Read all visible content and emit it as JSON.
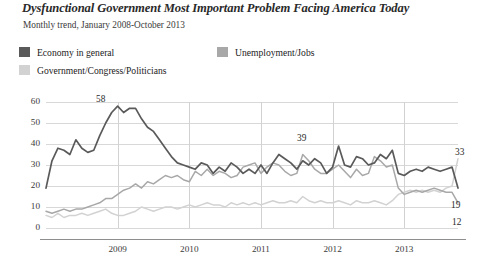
{
  "header": {
    "title": "Dysfunctional Government Most Important Problem Facing America Today",
    "subtitle": "Monthly trend, January 2008-October 2013"
  },
  "legend": [
    {
      "label": "Economy in general",
      "color": "#5a5a5a"
    },
    {
      "label": "Unemployment/Jobs",
      "color": "#a8a8a8"
    },
    {
      "label": "Government/Congress/Politicians",
      "color": "#d2d2d2"
    }
  ],
  "annotations": [
    {
      "name": "peak-economy",
      "value": "58"
    },
    {
      "name": "mid-economy",
      "value": "39"
    },
    {
      "name": "end-government",
      "value": "33"
    },
    {
      "name": "end-economy",
      "value": "19"
    },
    {
      "name": "end-unemployment",
      "value": "12"
    }
  ],
  "chart_data": {
    "type": "line",
    "title": "Dysfunctional Government Most Important Problem Facing America Today",
    "subtitle": "Monthly trend, January 2008-October 2013",
    "xlabel": "",
    "ylabel": "",
    "ylim": [
      0,
      60
    ],
    "yticks": [
      0,
      10,
      20,
      30,
      40,
      50,
      60
    ],
    "xticks": [
      "2009",
      "2010",
      "2011",
      "2012",
      "2013"
    ],
    "grid": true,
    "legend_position": "top",
    "x_start": "2008-01",
    "x_end": "2013-10",
    "series": [
      {
        "name": "Economy in general",
        "color": "#5a5a5a",
        "values": [
          19,
          32,
          38,
          37,
          35,
          42,
          38,
          36,
          37,
          44,
          50,
          55,
          58,
          55,
          57,
          57,
          52,
          48,
          46,
          42,
          38,
          34,
          31,
          30,
          29,
          28,
          31,
          30,
          26,
          29,
          27,
          31,
          29,
          26,
          28,
          26,
          30,
          26,
          31,
          35,
          33,
          31,
          28,
          32,
          30,
          33,
          31,
          26,
          29,
          39,
          30,
          29,
          34,
          33,
          30,
          31,
          35,
          33,
          37,
          26,
          25,
          27,
          28,
          27,
          29,
          28,
          27,
          28,
          29,
          19
        ],
        "end_label": "19"
      },
      {
        "name": "Unemployment/Jobs",
        "color": "#a8a8a8",
        "values": [
          8,
          7,
          8,
          9,
          8,
          9,
          9,
          10,
          11,
          12,
          14,
          14,
          16,
          18,
          19,
          21,
          19,
          22,
          21,
          23,
          25,
          24,
          25,
          23,
          22,
          27,
          25,
          28,
          25,
          27,
          26,
          24,
          25,
          29,
          30,
          31,
          26,
          29,
          31,
          30,
          27,
          25,
          26,
          35,
          32,
          28,
          26,
          26,
          28,
          30,
          27,
          24,
          28,
          25,
          26,
          34,
          32,
          29,
          30,
          19,
          16,
          17,
          18,
          17,
          18,
          19,
          18,
          17,
          17,
          12
        ],
        "end_label": "12"
      },
      {
        "name": "Government/Congress/Politicians",
        "color": "#d2d2d2",
        "values": [
          6,
          5,
          7,
          5,
          6,
          6,
          7,
          6,
          7,
          8,
          9,
          7,
          6,
          6,
          7,
          8,
          10,
          9,
          8,
          9,
          10,
          10,
          9,
          10,
          11,
          10,
          11,
          12,
          11,
          11,
          10,
          12,
          11,
          12,
          11,
          12,
          11,
          12,
          13,
          12,
          12,
          13,
          12,
          15,
          13,
          12,
          13,
          12,
          12,
          13,
          12,
          11,
          13,
          12,
          12,
          13,
          12,
          11,
          13,
          16,
          17,
          18,
          17,
          18,
          17,
          18,
          17,
          19,
          20,
          33
        ],
        "end_label": "33"
      }
    ]
  }
}
